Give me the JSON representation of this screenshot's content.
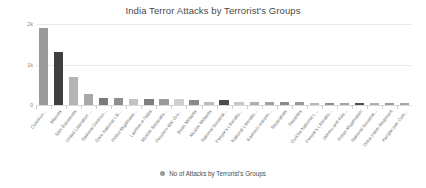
{
  "chart_data": {
    "type": "bar",
    "title": "India Terror Attacks by Terrorist's Groups",
    "xlabel": "",
    "ylabel": "",
    "ylim": [
      0,
      2000
    ],
    "yticks": [
      0,
      1000,
      2000
    ],
    "ytick_labels": [
      "0",
      "1k",
      "2k"
    ],
    "grid": true,
    "legend_position": "bottom",
    "legend": [
      "No of Attacks by Terrorist's Groups"
    ],
    "series_name": "No of Attacks by Terrorist's Groups",
    "bar_color": "#9a9a9a",
    "highlight_color": "#3f3f3f",
    "categories": [
      "Commun...",
      "Maoists",
      "Sikh Extremists",
      "United Liberation ...",
      "National Democr...",
      "Garo National Lib...",
      "Hizbul Mujahidee...",
      "Lashkar-e-Taiba",
      "Muslim Separatis...",
      "People's War Gro...",
      "Bodo Militants",
      "Muslim Militants",
      "National Socialist...",
      "People's Liberatio...",
      "National Liberatio...",
      "Kashmiri extremi...",
      "Separatists",
      "Naxalites",
      "Gurkha National L...",
      "People's Liberatio...",
      "Jammu and Kas...",
      "Indian Mujahideen",
      "National Socialist...",
      "Dima Halim Regiment",
      "Kanglei pak Com..."
    ],
    "values": [
      1900,
      1300,
      700,
      280,
      170,
      165,
      150,
      150,
      140,
      145,
      120,
      75,
      115,
      80,
      70,
      75,
      72,
      70,
      60,
      55,
      58,
      52,
      50,
      48,
      45
    ],
    "bar_shades": [
      "#9a9a9a",
      "#3f3f3f",
      "#b4b4b4",
      "#a8a8a8",
      "#7a7a7a",
      "#8e8e8e",
      "#c2c2c2",
      "#7e7e7e",
      "#9a9a9a",
      "#cfcfcf",
      "#8a8a8a",
      "#bdbdbd",
      "#4a4a4a",
      "#c7c7c7",
      "#b0b0b0",
      "#a0a0a0",
      "#8a8a8a",
      "#9a9a9a",
      "#b8b8b8",
      "#8e8e8e",
      "#a5a5a5",
      "#4f4f4f",
      "#b0b0b0",
      "#9a9a9a",
      "#a8a8a8"
    ]
  }
}
